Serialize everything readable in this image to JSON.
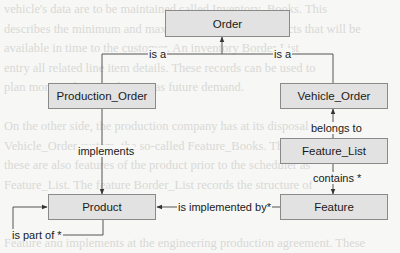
{
  "background_document": {
    "lines": [
      "vehicle's data are to be maintained called Inventory_Books. This",
      "describes the minimum and maximum numbers of products that will be",
      "available in time to the customer. An inventory Border List",
      "entry all related line item details. These records can be used to",
      "plan more in the a production as future demand.",
      "",
      "On the other side, the production company has at its disposal the",
      "Vehicle_Order system, the so-called Feature_Books. The systems and",
      "these are also features of the product prior to the scheduler as",
      "Feature_List. The feature Border_List records the structure of",
      "",
      "",
      "Feature and implements at the engineering production agreement. These",
      "as of product component and the implementation of the modules",
      "features will generate the respective sub-order and the production",
      "line."
    ]
  },
  "diagram": {
    "nodes": {
      "order": "Order",
      "production_order": "Production_Order",
      "vehicle_order": "Vehicle_Order",
      "feature_list": "Feature_List",
      "product": "Product",
      "feature": "Feature"
    },
    "edges": {
      "production_is_a": "is a",
      "vehicle_is_a": "is a",
      "belongs_to": "belongs to",
      "contains": "contains *",
      "implements": "implements",
      "is_implemented_by": "is implemented by*",
      "is_part_of": "is part of *"
    },
    "colors": {
      "box_fill": "#e2e2e2",
      "box_border": "#8a8a8a",
      "line": "#555555",
      "text": "#1a1a1a"
    }
  }
}
